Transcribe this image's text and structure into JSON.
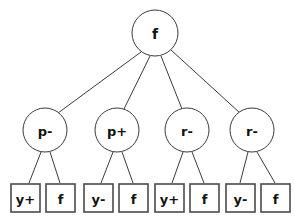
{
  "diagram": {
    "type": "tree",
    "title": "",
    "colors": {
      "background": "#ffffff",
      "circle_stroke": "#3a3a3a",
      "box_stroke": "#4a4a4a",
      "edge_stroke": "#3a3a3a",
      "text": "#111111"
    },
    "root": {
      "id": "root",
      "label": "f",
      "shape": "circle",
      "cx": 155,
      "cy": 33,
      "r": 23
    },
    "middle_nodes": [
      {
        "id": "mid-1",
        "label": "p-",
        "shape": "circle",
        "cx": 45,
        "cy": 130,
        "r": 22
      },
      {
        "id": "mid-2",
        "label": "p+",
        "shape": "circle",
        "cx": 117,
        "cy": 130,
        "r": 22
      },
      {
        "id": "mid-3",
        "label": "r-",
        "shape": "circle",
        "cx": 187,
        "cy": 130,
        "r": 22
      },
      {
        "id": "mid-4",
        "label": "r-",
        "shape": "circle",
        "cx": 252,
        "cy": 130,
        "r": 22
      }
    ],
    "leaf_nodes": [
      {
        "id": "leaf-1",
        "label": "y+",
        "shape": "rect",
        "x": 11,
        "y": 184,
        "w": 29,
        "h": 28,
        "parent": "mid-1"
      },
      {
        "id": "leaf-2",
        "label": "f",
        "shape": "rect",
        "x": 46,
        "y": 184,
        "w": 29,
        "h": 28,
        "parent": "mid-1"
      },
      {
        "id": "leaf-3",
        "label": "y-",
        "shape": "rect",
        "x": 84,
        "y": 184,
        "w": 29,
        "h": 28,
        "parent": "mid-2"
      },
      {
        "id": "leaf-4",
        "label": "f",
        "shape": "rect",
        "x": 119,
        "y": 184,
        "w": 29,
        "h": 28,
        "parent": "mid-2"
      },
      {
        "id": "leaf-5",
        "label": "y+",
        "shape": "rect",
        "x": 155,
        "y": 184,
        "w": 29,
        "h": 28,
        "parent": "mid-3"
      },
      {
        "id": "leaf-6",
        "label": "f",
        "shape": "rect",
        "x": 190,
        "y": 184,
        "w": 29,
        "h": 28,
        "parent": "mid-3"
      },
      {
        "id": "leaf-7",
        "label": "y-",
        "shape": "rect",
        "x": 226,
        "y": 184,
        "w": 29,
        "h": 28,
        "parent": "mid-4"
      },
      {
        "id": "leaf-8",
        "label": "f",
        "shape": "rect",
        "x": 261,
        "y": 184,
        "w": 29,
        "h": 28,
        "parent": "mid-4"
      }
    ],
    "edges": [
      {
        "id": "edge-root-1",
        "from": "root",
        "to": "mid-1",
        "x1": 141,
        "y1": 52,
        "x2": 58,
        "y2": 113
      },
      {
        "id": "edge-root-2",
        "from": "root",
        "to": "mid-2",
        "x1": 150,
        "y1": 56,
        "x2": 124,
        "y2": 109
      },
      {
        "id": "edge-root-3",
        "from": "root",
        "to": "mid-3",
        "x1": 161,
        "y1": 56,
        "x2": 182,
        "y2": 109
      },
      {
        "id": "edge-root-4",
        "from": "root",
        "to": "mid-4",
        "x1": 171,
        "y1": 50,
        "x2": 240,
        "y2": 113
      },
      {
        "id": "edge-mid1-leaf1",
        "from": "mid-1",
        "to": "leaf-1",
        "x1": 41,
        "y1": 152,
        "x2": 29,
        "y2": 183
      },
      {
        "id": "edge-mid1-leaf2",
        "from": "mid-1",
        "to": "leaf-2",
        "x1": 50,
        "y1": 152,
        "x2": 60,
        "y2": 183
      },
      {
        "id": "edge-mid2-leaf3",
        "from": "mid-2",
        "to": "leaf-3",
        "x1": 113,
        "y1": 152,
        "x2": 101,
        "y2": 183
      },
      {
        "id": "edge-mid2-leaf4",
        "from": "mid-2",
        "to": "leaf-4",
        "x1": 122,
        "y1": 152,
        "x2": 133,
        "y2": 183
      },
      {
        "id": "edge-mid3-leaf5",
        "from": "mid-3",
        "to": "leaf-5",
        "x1": 183,
        "y1": 152,
        "x2": 172,
        "y2": 183
      },
      {
        "id": "edge-mid3-leaf6",
        "from": "mid-3",
        "to": "leaf-6",
        "x1": 192,
        "y1": 152,
        "x2": 204,
        "y2": 183
      },
      {
        "id": "edge-mid4-leaf7",
        "from": "mid-4",
        "to": "leaf-7",
        "x1": 248,
        "y1": 152,
        "x2": 240,
        "y2": 183
      },
      {
        "id": "edge-mid4-leaf8",
        "from": "mid-4",
        "to": "leaf-8",
        "x1": 257,
        "y1": 152,
        "x2": 275,
        "y2": 183
      }
    ]
  }
}
